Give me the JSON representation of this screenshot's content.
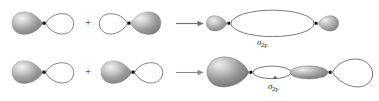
{
  "figure": {
    "background_color": "#ffffff",
    "width": 379,
    "height": 101,
    "lobe_fill_shaded": "#8c8c8c",
    "lobe_fill_highlight": "#e8e8e8",
    "lobe_fill_empty": "#ffffff",
    "outline_color": "#4d4d4d",
    "nucleus_color": "#111111",
    "arrow_color": "#6e6e6e",
    "text_color": "#1a1a1a"
  },
  "rows": [
    {
      "id": "bonding",
      "operator_plus": "+",
      "arrow": "→",
      "result_label": {
        "symbol": "σ",
        "subscript": "2p",
        "superscript": "",
        "full_text": "σ2p"
      },
      "terms": [
        {
          "name": "p-orbital-left",
          "left_lobe": "shaded",
          "right_lobe": "empty"
        },
        {
          "name": "p-orbital-right",
          "left_lobe": "empty",
          "right_lobe": "shaded"
        }
      ],
      "product": {
        "name": "sigma-2p-bonding-orbital",
        "description": "small shaded end lobes with large central empty ellipse",
        "nuclei": 2
      }
    },
    {
      "id": "antibonding",
      "operator_plus": "+",
      "arrow": "→",
      "result_label": {
        "symbol": "σ",
        "subscript": "2p",
        "superscript": "*",
        "full_text": "σ*2p"
      },
      "terms": [
        {
          "name": "p-orbital-left",
          "left_lobe": "shaded",
          "right_lobe": "empty"
        },
        {
          "name": "p-orbital-right",
          "left_lobe": "shaded",
          "right_lobe": "empty"
        }
      ],
      "product": {
        "name": "sigma-2p-antibonding-orbital",
        "description": "large shaded outer lobe, small empty ellipse, shaded ellipse, large empty outer lobe",
        "nuclei": 2
      }
    }
  ]
}
